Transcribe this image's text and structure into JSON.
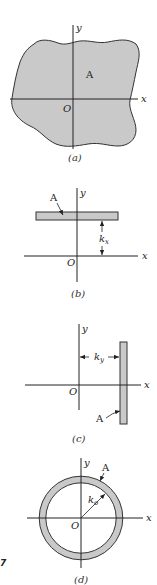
{
  "colors": {
    "fill": "#c9c9c9",
    "stroke": "#333333",
    "background": "#ffffff"
  },
  "figure_number": "2.7",
  "figure_number_visible": "7",
  "panels": [
    {
      "id": "a",
      "caption": "(a)",
      "labels": {
        "area": "A",
        "origin": "O",
        "x_axis": "x",
        "y_axis": "y"
      },
      "description": "Arbitrary irregular area A with x and y axes through origin O"
    },
    {
      "id": "b",
      "caption": "(b)",
      "labels": {
        "area": "A",
        "origin": "O",
        "x_axis": "x",
        "y_axis": "y",
        "radius": "k",
        "radius_sub": "x"
      },
      "description": "Thin horizontal strip of area A at distance kx from the x-axis"
    },
    {
      "id": "c",
      "caption": "(c)",
      "labels": {
        "area": "A",
        "origin": "O",
        "x_axis": "x",
        "y_axis": "y",
        "radius": "k",
        "radius_sub": "y"
      },
      "description": "Thin vertical strip of area A at distance ky from the y-axis"
    },
    {
      "id": "d",
      "caption": "(d)",
      "labels": {
        "area": "A",
        "origin": "O",
        "x_axis": "x",
        "y_axis": "y",
        "radius": "k",
        "radius_sub": "o"
      },
      "description": "Thin ring of area A at radius ko from origin O"
    }
  ]
}
